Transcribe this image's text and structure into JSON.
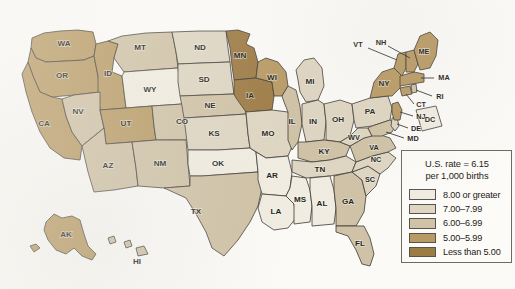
{
  "map": {
    "title": "Infant mortality rate by state",
    "type": "choropleth",
    "background_color": "#fbfaf7",
    "border_color": "#3c3a34",
    "palette": {
      "c1": "#f0ece1",
      "c2": "#ded5c2",
      "c3": "#cfc2a6",
      "c4": "#b89a64",
      "c5": "#9d7b45"
    },
    "lake_color": "#ffffff"
  },
  "legend": {
    "title_line1": "U.S. rate = 6.15",
    "title_line2": "per 1,000 births",
    "items": [
      {
        "label": "8.00 or greater",
        "color": "#f0ece1",
        "bin": "c1"
      },
      {
        "label": "7.00–7.99",
        "color": "#ded5c2",
        "bin": "c2"
      },
      {
        "label": "6.00–6.99",
        "color": "#cfc2a6",
        "bin": "c3"
      },
      {
        "label": "5.00–5.99",
        "color": "#b89a64",
        "bin": "c4"
      },
      {
        "label": "Less than 5.00",
        "color": "#9d7b45",
        "bin": "c5"
      }
    ]
  },
  "chart_data": {
    "type": "heatmap",
    "unit": "deaths per 1,000 births",
    "national_rate": 6.15,
    "bins": [
      "8.00 or greater",
      "7.00–7.99",
      "6.00–6.99",
      "5.00–5.99",
      "Less than 5.00"
    ],
    "states": [
      {
        "code": "WA",
        "bin": "5.00–5.99"
      },
      {
        "code": "OR",
        "bin": "5.00–5.99"
      },
      {
        "code": "CA",
        "bin": "5.00–5.99"
      },
      {
        "code": "ID",
        "bin": "5.00–5.99"
      },
      {
        "code": "NV",
        "bin": "6.00–6.99"
      },
      {
        "code": "MT",
        "bin": "6.00–6.99"
      },
      {
        "code": "WY",
        "bin": "8.00 or greater"
      },
      {
        "code": "UT",
        "bin": "5.00–5.99"
      },
      {
        "code": "AZ",
        "bin": "6.00–6.99"
      },
      {
        "code": "CO",
        "bin": "6.00–6.99"
      },
      {
        "code": "NM",
        "bin": "6.00–6.99"
      },
      {
        "code": "ND",
        "bin": "7.00–7.99"
      },
      {
        "code": "SD",
        "bin": "7.00–7.99"
      },
      {
        "code": "NE",
        "bin": "6.00–6.99"
      },
      {
        "code": "KS",
        "bin": "7.00–7.99"
      },
      {
        "code": "OK",
        "bin": "8.00 or greater"
      },
      {
        "code": "TX",
        "bin": "6.00–6.99"
      },
      {
        "code": "MN",
        "bin": "Less than 5.00"
      },
      {
        "code": "IA",
        "bin": "Less than 5.00"
      },
      {
        "code": "WI",
        "bin": "5.00–5.99"
      },
      {
        "code": "MO",
        "bin": "7.00–7.99"
      },
      {
        "code": "AR",
        "bin": "8.00 or greater"
      },
      {
        "code": "LA",
        "bin": "8.00 or greater"
      },
      {
        "code": "IL",
        "bin": "6.00–6.99"
      },
      {
        "code": "MI",
        "bin": "7.00–7.99"
      },
      {
        "code": "IN",
        "bin": "7.00–7.99"
      },
      {
        "code": "OH",
        "bin": "7.00–7.99"
      },
      {
        "code": "KY",
        "bin": "6.00–6.99"
      },
      {
        "code": "TN",
        "bin": "7.00–7.99"
      },
      {
        "code": "MS",
        "bin": "8.00 or greater"
      },
      {
        "code": "AL",
        "bin": "8.00 or greater"
      },
      {
        "code": "GA",
        "bin": "6.00–6.99"
      },
      {
        "code": "FL",
        "bin": "6.00–6.99"
      },
      {
        "code": "SC",
        "bin": "7.00–7.99"
      },
      {
        "code": "NC",
        "bin": "7.00–7.99"
      },
      {
        "code": "VA",
        "bin": "6.00–6.99"
      },
      {
        "code": "WV",
        "bin": "7.00–7.99"
      },
      {
        "code": "MD",
        "bin": "6.00–6.99"
      },
      {
        "code": "DE",
        "bin": "7.00–7.99"
      },
      {
        "code": "PA",
        "bin": "7.00–7.99"
      },
      {
        "code": "NJ",
        "bin": "5.00–5.99"
      },
      {
        "code": "NY",
        "bin": "5.00–5.99"
      },
      {
        "code": "CT",
        "bin": "5.00–5.99"
      },
      {
        "code": "RI",
        "bin": "6.00–6.99"
      },
      {
        "code": "MA",
        "bin": "5.00–5.99"
      },
      {
        "code": "VT",
        "bin": "5.00–5.99"
      },
      {
        "code": "NH",
        "bin": "5.00–5.99"
      },
      {
        "code": "ME",
        "bin": "5.00–5.99"
      },
      {
        "code": "AK",
        "bin": "5.00–5.99"
      },
      {
        "code": "HI",
        "bin": "6.00–6.99"
      },
      {
        "code": "DC",
        "bin": "8.00 or greater"
      }
    ]
  },
  "labels": {
    "WA": "WA",
    "OR": "OR",
    "CA": "CA",
    "ID": "ID",
    "NV": "NV",
    "MT": "MT",
    "WY": "WY",
    "UT": "UT",
    "AZ": "AZ",
    "CO": "CO",
    "NM": "NM",
    "ND": "ND",
    "SD": "SD",
    "NE": "NE",
    "KS": "KS",
    "OK": "OK",
    "TX": "TX",
    "MN": "MN",
    "IA": "IA",
    "WI": "WI",
    "MO": "MO",
    "AR": "AR",
    "LA": "LA",
    "IL": "IL",
    "MI": "MI",
    "IN": "IN",
    "OH": "OH",
    "KY": "KY",
    "TN": "TN",
    "MS": "MS",
    "AL": "AL",
    "GA": "GA",
    "FL": "FL",
    "SC": "SC",
    "NC": "NC",
    "VA": "VA",
    "WV": "WV",
    "MD": "MD",
    "DE": "DE",
    "PA": "PA",
    "NJ": "NJ",
    "NY": "NY",
    "CT": "CT",
    "RI": "RI",
    "MA": "MA",
    "VT": "VT",
    "NH": "NH",
    "ME": "ME",
    "AK": "AK",
    "HI": "HI",
    "DC": "DC"
  }
}
